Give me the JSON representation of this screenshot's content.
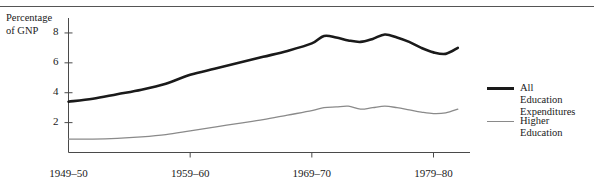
{
  "chart_data": {
    "type": "line",
    "title": "",
    "subtitle": "",
    "xlabel": "",
    "ylabel": "Percentage\nof GNP",
    "ylim": [
      0,
      9
    ],
    "xlim": [
      1949,
      1982
    ],
    "grid": false,
    "legend_position": "right",
    "y_ticks": [
      2,
      4,
      6,
      8
    ],
    "y_tick_labels": [
      "2",
      "4",
      "6",
      "8"
    ],
    "x_ticks": [
      1949,
      1959,
      1969,
      1979
    ],
    "x_tick_labels": [
      "1949–50",
      "1959–60",
      "1969–70",
      "1979–80"
    ],
    "series": [
      {
        "name": "All Education Expenditures",
        "color": "#1a1a1a",
        "linewidth": 2.6,
        "x": [
          1949,
          1951,
          1953,
          1955,
          1957,
          1959,
          1961,
          1963,
          1965,
          1967,
          1969,
          1970,
          1971,
          1972,
          1973,
          1974,
          1975,
          1976,
          1977,
          1978,
          1979,
          1980,
          1981
        ],
        "values": [
          3.4,
          3.6,
          3.9,
          4.2,
          4.6,
          5.2,
          5.6,
          6.0,
          6.4,
          6.8,
          7.3,
          7.8,
          7.7,
          7.5,
          7.4,
          7.6,
          7.9,
          7.7,
          7.4,
          7.0,
          6.7,
          6.6,
          7.0
        ]
      },
      {
        "name": "Higher Education",
        "color": "#8a8a8a",
        "linewidth": 1.3,
        "x": [
          1949,
          1951,
          1953,
          1955,
          1957,
          1959,
          1961,
          1963,
          1965,
          1967,
          1969,
          1970,
          1971,
          1972,
          1973,
          1974,
          1975,
          1976,
          1977,
          1978,
          1979,
          1980,
          1981
        ],
        "values": [
          0.9,
          0.9,
          0.95,
          1.05,
          1.2,
          1.45,
          1.7,
          1.95,
          2.2,
          2.5,
          2.8,
          3.0,
          3.05,
          3.1,
          2.9,
          3.0,
          3.1,
          3.0,
          2.85,
          2.7,
          2.6,
          2.65,
          2.9
        ]
      }
    ],
    "legend": [
      {
        "label": "All Education\nExpenditures",
        "color": "#1a1a1a",
        "style": "thick"
      },
      {
        "label": "Higher\nEducation",
        "color": "#8a8a8a",
        "style": "thin"
      }
    ]
  },
  "figure": {
    "axis_title": "Percentage\nof GNP",
    "y_labels": [
      "8",
      "6",
      "4",
      "2"
    ],
    "x_labels": [
      "1949–50",
      "1959–60",
      "1969–70",
      "1979–80"
    ],
    "legend_items": [
      "All Education\nExpenditures",
      "Higher\nEducation"
    ],
    "accent_dark": "#1a1a1a",
    "accent_gray": "#8a8a8a"
  }
}
